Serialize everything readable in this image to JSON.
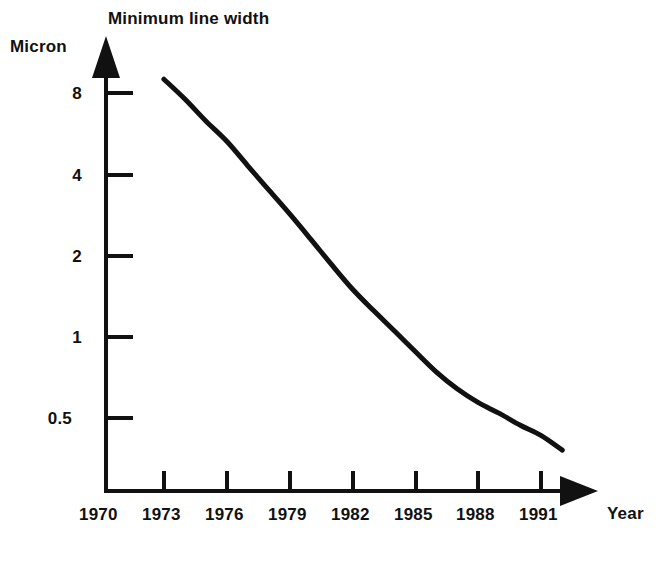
{
  "chart_data": {
    "type": "line",
    "title": "Minimum line width",
    "xlabel": "Year",
    "ylabel": "Micron",
    "yscale": "log",
    "xlim": [
      1970,
      1992.5
    ],
    "ylim": [
      0.33,
      10.5
    ],
    "grid": false,
    "legend": null,
    "x_ticks": [
      "1970",
      "1973",
      "1976",
      "1979",
      "1982",
      "1985",
      "1988",
      "1991"
    ],
    "x_tick_values": [
      1970,
      1973,
      1976,
      1979,
      1982,
      1985,
      1988,
      1991
    ],
    "y_ticks": [
      "8",
      "4",
      "2",
      "1",
      "0.5"
    ],
    "y_tick_values": [
      8,
      4,
      2,
      1,
      0.5
    ],
    "series": [
      {
        "name": "Minimum line width",
        "x": [
          1973.0,
          1974.0,
          1975.0,
          1976.0,
          1977.0,
          1978.0,
          1979.0,
          1980.0,
          1981.0,
          1982.0,
          1983.0,
          1984.0,
          1985.0,
          1986.0,
          1987.0,
          1988.0,
          1989.0,
          1990.0,
          1991.0,
          1992.0
        ],
        "values": [
          9.0,
          7.6,
          6.3,
          5.3,
          4.3,
          3.5,
          2.85,
          2.3,
          1.85,
          1.5,
          1.25,
          1.05,
          0.88,
          0.74,
          0.64,
          0.57,
          0.52,
          0.47,
          0.43,
          0.38
        ]
      }
    ]
  },
  "chart": {
    "title": "Minimum line width",
    "y_axis_label": "Micron",
    "x_axis_label": "Year",
    "y_tick_labels": [
      "8",
      "4",
      "2",
      "1",
      "0.5"
    ],
    "x_tick_labels": [
      "1970",
      "1973",
      "1976",
      "1979",
      "1982",
      "1985",
      "1988",
      "1991"
    ],
    "line_color": "#111111",
    "axis_color": "#111111",
    "background_color": "#ffffff"
  }
}
